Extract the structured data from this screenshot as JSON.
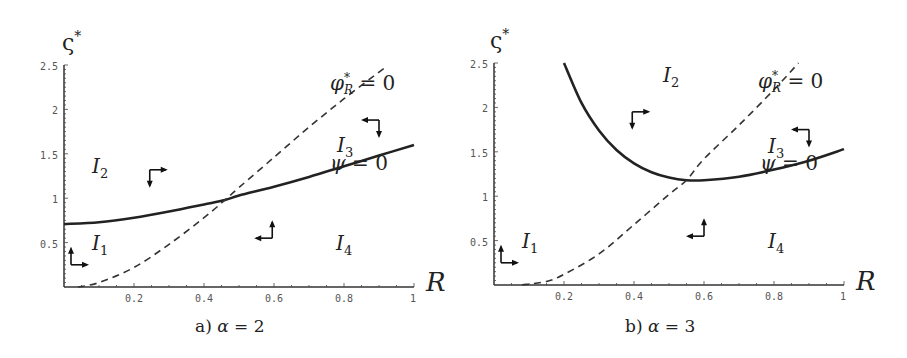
{
  "chart_data": [
    {
      "type": "line",
      "panel": "a",
      "caption": "a) α = 2",
      "ylabel": "ς*",
      "xlabel": "R",
      "xlim": [
        0,
        1
      ],
      "ylim": [
        0,
        2.5
      ],
      "xticks": [
        "0.2",
        "0.4",
        "0.6",
        "0.8",
        "1"
      ],
      "yticks": [
        "0.5",
        "1",
        "1.5",
        "2",
        "2.5"
      ],
      "grid": false,
      "series": [
        {
          "name": "ψ = 0",
          "style": "solid",
          "x": [
            0,
            0.1,
            0.2,
            0.3,
            0.4,
            0.46,
            0.5,
            0.6,
            0.7,
            0.8,
            0.9,
            1.0
          ],
          "y": [
            0.71,
            0.73,
            0.78,
            0.85,
            0.93,
            0.98,
            1.03,
            1.13,
            1.24,
            1.36,
            1.48,
            1.6
          ]
        },
        {
          "name": "φ*_R = 0",
          "style": "dashed",
          "x": [
            0.04,
            0.1,
            0.2,
            0.3,
            0.4,
            0.46,
            0.5,
            0.6,
            0.7,
            0.8,
            0.9,
            0.92
          ],
          "y": [
            0.0,
            0.05,
            0.22,
            0.48,
            0.78,
            0.98,
            1.12,
            1.46,
            1.8,
            2.12,
            2.42,
            2.48
          ]
        }
      ],
      "annotations": [
        {
          "text": "I₂",
          "x": 0.07,
          "y": 1.35
        },
        {
          "text": "I₁",
          "x": 0.07,
          "y": 0.45
        },
        {
          "text": "I₃",
          "x": 0.77,
          "y": 1.62
        },
        {
          "text": "I₄",
          "x": 0.78,
          "y": 0.45
        },
        {
          "text": "φ*_R = 0",
          "x": 0.77,
          "y": 2.2
        },
        {
          "text": "ψ = 0",
          "x": 0.76,
          "y": 1.4
        }
      ],
      "arrows": [
        {
          "x": 0.245,
          "y": 1.32,
          "h": "right",
          "v": "down"
        },
        {
          "x": 0.595,
          "y": 0.55,
          "h": "left",
          "v": "up"
        },
        {
          "x": 0.9,
          "y": 1.88,
          "h": "left",
          "v": "down"
        },
        {
          "x": 0.02,
          "y": 0.25,
          "h": "right",
          "v": "up"
        }
      ]
    },
    {
      "type": "line",
      "panel": "b",
      "caption": "b) α = 3",
      "ylabel": "ς*",
      "xlabel": "R",
      "xlim": [
        0,
        1
      ],
      "ylim": [
        0,
        2.5
      ],
      "xticks": [
        "0.2",
        "0.4",
        "0.6",
        "0.8",
        "1"
      ],
      "yticks": [
        "0.5",
        "1",
        "1.5",
        "2",
        "2.5"
      ],
      "grid": false,
      "series": [
        {
          "name": "ψ = 0",
          "style": "solid",
          "x": [
            0.2,
            0.25,
            0.3,
            0.35,
            0.4,
            0.45,
            0.5,
            0.55,
            0.6,
            0.7,
            0.8,
            0.9,
            1.0
          ],
          "y": [
            2.5,
            2.05,
            1.74,
            1.52,
            1.37,
            1.27,
            1.21,
            1.18,
            1.18,
            1.22,
            1.3,
            1.4,
            1.53
          ]
        },
        {
          "name": "φ*_R = 0",
          "style": "dashed",
          "x": [
            0.08,
            0.15,
            0.2,
            0.3,
            0.4,
            0.5,
            0.55,
            0.6,
            0.7,
            0.8,
            0.87
          ],
          "y": [
            0.0,
            0.04,
            0.12,
            0.35,
            0.68,
            1.02,
            1.18,
            1.42,
            1.8,
            2.2,
            2.5
          ]
        }
      ],
      "annotations": [
        {
          "text": "I₂",
          "x": 0.4,
          "y": 2.35
        },
        {
          "text": "I₁",
          "x": 0.07,
          "y": 0.45
        },
        {
          "text": "I₃",
          "x": 0.77,
          "y": 1.62
        },
        {
          "text": "I₄",
          "x": 0.78,
          "y": 0.45
        },
        {
          "text": "φ*_R = 0",
          "x": 0.77,
          "y": 2.2
        },
        {
          "text": "ψ = 0",
          "x": 0.76,
          "y": 1.4
        }
      ],
      "arrows": [
        {
          "x": 0.395,
          "y": 1.95,
          "h": "right",
          "v": "down"
        },
        {
          "x": 0.6,
          "y": 0.55,
          "h": "left",
          "v": "up"
        },
        {
          "x": 0.9,
          "y": 1.75,
          "h": "left",
          "v": "down"
        },
        {
          "x": 0.02,
          "y": 0.25,
          "h": "right",
          "v": "up"
        }
      ]
    }
  ],
  "panels": {
    "a": {
      "caption_prefix": "a)",
      "caption_var": "α",
      "caption_rest": " = 2",
      "ylabel": "ς",
      "ylabel_sup": "*",
      "xlabel": "R",
      "region_I1": "I",
      "region_I1_sub": "1",
      "region_I2": "I",
      "region_I2_sub": "2",
      "region_I3": "I",
      "region_I3_sub": "3",
      "region_I4": "I",
      "region_I4_sub": "4",
      "phi_label": "φ",
      "phi_sup": "*",
      "phi_sub": "R",
      "phi_rest": " = 0",
      "psi_label": "ψ",
      "psi_rest": " = 0"
    },
    "b": {
      "caption_prefix": "b)",
      "caption_var": "α",
      "caption_rest": " = 3",
      "ylabel": "ς",
      "ylabel_sup": "*",
      "xlabel": "R",
      "region_I1": "I",
      "region_I1_sub": "1",
      "region_I2": "I",
      "region_I2_sub": "2",
      "region_I3": "I",
      "region_I3_sub": "3",
      "region_I4": "I",
      "region_I4_sub": "4",
      "phi_label": "φ",
      "phi_sup": "*",
      "phi_sub": "R",
      "phi_rest": " = 0",
      "psi_label": "ψ",
      "psi_rest": " = 0"
    }
  },
  "colors": {
    "curve": "#222222",
    "axis": "#333333",
    "tick_text": "#555555"
  }
}
